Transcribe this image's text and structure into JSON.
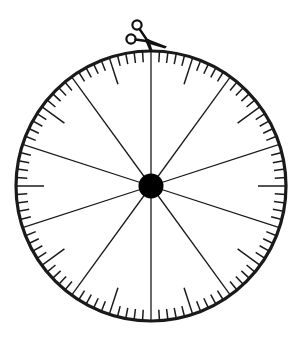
{
  "diagram": {
    "type": "spinner-wheel",
    "center": {
      "x": 151,
      "y": 186
    },
    "radius": 135,
    "rim_stroke_width": 3.2,
    "spoke_count": 10,
    "spoke_start_angle_deg": 0,
    "tick_count": 100,
    "short_tick_length": 11,
    "long_tick_length": 28,
    "long_tick_every": 10,
    "long_tick_offset": 5,
    "hub_radius": 12.5,
    "colors": {
      "line": "#1a1a1a",
      "rim": "#1a1a1a",
      "hub": "#000000",
      "background": "#ffffff"
    },
    "pointer": {
      "icon": "scissors-icon",
      "position": "top"
    }
  }
}
